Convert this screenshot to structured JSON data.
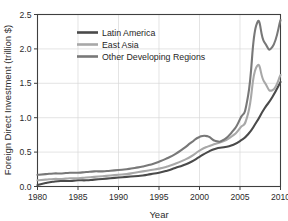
{
  "figure": {
    "clipped_title_fragment": "y                    f       g",
    "background_color": "#ffffff"
  },
  "chart_data": {
    "type": "line",
    "title": "",
    "xlabel": "Year",
    "ylabel": "Foreign Direct Investment (trillion $)",
    "xlim": [
      1980,
      2010
    ],
    "ylim": [
      0.0,
      2.5
    ],
    "xticks": [
      1980,
      1985,
      1990,
      1995,
      2000,
      2005,
      2010
    ],
    "xtick_labels": [
      "1980",
      "1985",
      "1990",
      "1995",
      "2000",
      "2005",
      "2010"
    ],
    "yticks": [
      0.0,
      0.5,
      1.0,
      1.5,
      2.0,
      2.5
    ],
    "ytick_labels": [
      "0.0",
      "0.5",
      "1.0",
      "1.5",
      "2.0",
      "2.5"
    ],
    "grid": true,
    "grid_axis": "y-and-x",
    "legend_position": "upper-left-inside",
    "x": [
      1980,
      1981,
      1982,
      1983,
      1984,
      1985,
      1986,
      1987,
      1988,
      1989,
      1990,
      1991,
      1992,
      1993,
      1994,
      1995,
      1996,
      1997,
      1998,
      1999,
      2000,
      2001,
      2002,
      2003,
      2004,
      2005,
      2006,
      2007,
      2008,
      2009,
      2010
    ],
    "series": [
      {
        "name": "Latin America",
        "color": "#4a4a4a",
        "values": [
          0.02,
          0.05,
          0.07,
          0.08,
          0.08,
          0.09,
          0.09,
          0.1,
          0.11,
          0.12,
          0.13,
          0.14,
          0.15,
          0.16,
          0.18,
          0.2,
          0.23,
          0.27,
          0.31,
          0.36,
          0.43,
          0.5,
          0.55,
          0.57,
          0.6,
          0.66,
          0.76,
          0.93,
          1.13,
          1.3,
          1.52
        ]
      },
      {
        "name": "East Asia",
        "color": "#a8a8a8",
        "values": [
          0.09,
          0.1,
          0.11,
          0.11,
          0.12,
          0.12,
          0.13,
          0.14,
          0.15,
          0.16,
          0.17,
          0.18,
          0.2,
          0.22,
          0.24,
          0.26,
          0.29,
          0.33,
          0.38,
          0.44,
          0.52,
          0.58,
          0.62,
          0.66,
          0.73,
          0.85,
          1.06,
          1.73,
          1.52,
          1.4,
          1.62
        ]
      },
      {
        "name": "Other Developing Regions",
        "color": "#787878",
        "values": [
          0.17,
          0.18,
          0.19,
          0.19,
          0.2,
          0.2,
          0.21,
          0.22,
          0.22,
          0.23,
          0.24,
          0.25,
          0.27,
          0.29,
          0.32,
          0.36,
          0.41,
          0.47,
          0.55,
          0.64,
          0.72,
          0.73,
          0.66,
          0.68,
          0.79,
          0.98,
          1.32,
          2.34,
          2.1,
          2.03,
          2.42
        ]
      }
    ]
  },
  "legend": {
    "entries": [
      {
        "label": "Latin America"
      },
      {
        "label": "East Asia"
      },
      {
        "label": "Other Developing Regions"
      }
    ]
  }
}
